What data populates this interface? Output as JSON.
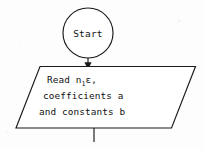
{
  "diagram": {
    "type": "flowchart",
    "title": "",
    "background_color": "#fdfdfd",
    "stroke_color": "#1a1a1a",
    "fill_color": "#ffffff",
    "nodes": [
      {
        "id": "start",
        "shape": "terminal-circle",
        "label": "Start",
        "name": "terminator-start"
      },
      {
        "id": "read",
        "shape": "parallelogram-io",
        "name": "io-read-inputs",
        "lines": [
          {
            "pre": "Read n",
            "sub": "1",
            "post": "ε,"
          },
          {
            "pre": "coefficients a",
            "sub": "",
            "post": ""
          },
          {
            "pre": "and constants b",
            "sub": "",
            "post": ""
          }
        ]
      }
    ],
    "connectors": [
      {
        "id": "start-to-read",
        "name": "connector-start-to-read",
        "from": "start",
        "to": "read",
        "arrow": true,
        "label": ""
      },
      {
        "id": "read-to-next",
        "name": "connector-read-outgoing",
        "from": "read",
        "to": "",
        "arrow": false,
        "label": ""
      }
    ]
  }
}
